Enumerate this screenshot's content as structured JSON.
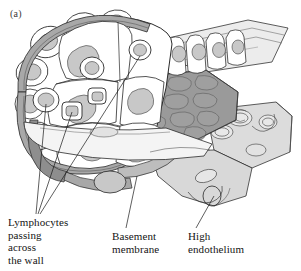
{
  "figure": {
    "panel_label": "(a)",
    "background_color": "#ffffff",
    "outline_color": "#1a1a1a"
  },
  "callouts": [
    {
      "id": "lymphocytes",
      "text": "Lymphocytes\npassing\nacross\nthe wall",
      "leader_count": 3
    },
    {
      "id": "basement_membrane",
      "text": "Basement\nmembrane",
      "leader_count": 1
    },
    {
      "id": "high_endothelium",
      "text": "High\nendothelium",
      "leader_count": 1
    }
  ],
  "palette": {
    "paper": "#ffffff",
    "ink": "#1a1a1a",
    "lumen_cobble": "#9a9a9a",
    "lumen_cobble_dark": "#8a8a8a",
    "nucleus": "#c8c8c8",
    "basement_band": "#a8a8a8",
    "cut_face_light": "#ececec",
    "cut_face": "#dcdcdc",
    "cell_body": "#ffffff",
    "shadow": "#7c7c7c"
  }
}
